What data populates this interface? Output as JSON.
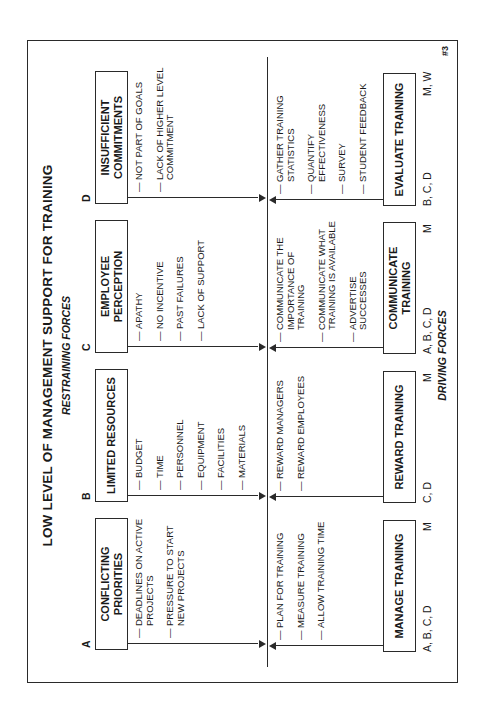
{
  "title": "LOW LEVEL OF MANAGEMENT SUPPORT FOR TRAINING",
  "restraining_label": "RESTRAINING FORCES",
  "driving_label": "DRIVING FORCES",
  "page_number": "#3",
  "restraining": [
    {
      "letter": "A",
      "label": "CONFLICTING\nPRIORITIES",
      "items": [
        "DEADLINES ON ACTIVE\nPROJECTS",
        "PRESSURE TO START\nNEW PROJECTS"
      ]
    },
    {
      "letter": "B",
      "label": "LIMITED RESOURCES",
      "items": [
        "BUDGET",
        "TIME",
        "PERSONNEL",
        "EQUIPMENT",
        "FACILITIES",
        "MATERIALS"
      ]
    },
    {
      "letter": "C",
      "label": "EMPLOYEE PERCEPTION",
      "items": [
        "APATHY",
        "NO INCENTIVE",
        "PAST FAILURES",
        "LACK OF SUPPORT"
      ]
    },
    {
      "letter": "D",
      "label": "INSUFFICIENT\nCOMMITMENTS",
      "items": [
        "NOT PART OF GOALS",
        "LACK OF HIGHER LEVEL\nCOMMITMENT"
      ]
    }
  ],
  "driving": [
    {
      "label": "MANAGE TRAINING",
      "addresses": "A, B, C, D",
      "owner": "M",
      "items": [
        "PLAN FOR TRAINING",
        "MEASURE TRAINING",
        "ALLOW TRAINING TIME"
      ]
    },
    {
      "label": "REWARD TRAINING",
      "addresses": "C, D",
      "owner": "M",
      "items": [
        "REWARD MANAGERS",
        "REWARD EMPLOYEES"
      ]
    },
    {
      "label": "COMMUNICATE\nTRAINING",
      "addresses": "A, B, C, D",
      "owner": "M",
      "items": [
        "COMMUNICATE THE\nIMPORTANCE OF\nTRAINING",
        "COMMUNICATE WHAT\nTRAINING IS AVAILABLE",
        "ADVERTISE SUCCESSES"
      ]
    },
    {
      "label": "EVALUATE TRAINING",
      "addresses": "B, C, D",
      "owner": "M, W",
      "items": [
        "GATHER TRAINING\nSTATISTICS",
        "QUANTIFY\nEFFECTIVENESS",
        "SURVEY",
        "STUDENT FEEDBACK"
      ]
    }
  ]
}
